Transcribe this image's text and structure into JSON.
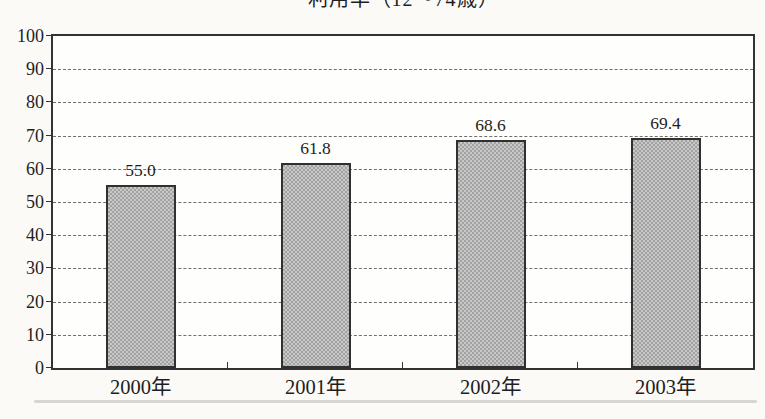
{
  "chart_data": {
    "type": "bar",
    "title": "利用率（12～74歳）",
    "title_note": "partially clipped at top edge of image",
    "categories": [
      "2000年",
      "2001年",
      "2002年",
      "2003年"
    ],
    "values": [
      55.0,
      61.8,
      68.6,
      69.4
    ],
    "value_labels": [
      "55.0",
      "61.8",
      "68.6",
      "69.4"
    ],
    "xlabel": "",
    "ylabel": "",
    "ylim": [
      0,
      100
    ],
    "yticks": [
      0,
      10,
      20,
      30,
      40,
      50,
      60,
      70,
      80,
      90,
      100
    ],
    "grid": "horizontal dashed gridlines at every 10 units",
    "legend": "none",
    "bar_style": "gray halftone-dot fill with dark border, single series"
  },
  "colors": {
    "background": "#fbfaf7",
    "plot_background": "#fefefd",
    "axis_border": "#333333",
    "gridline": "#6e6e6e",
    "bar_fill": "#c8c8c8",
    "bar_dot": "#a2a2a2",
    "bar_border": "#303030",
    "text": "#1e1e1e",
    "scan_artifact": "#cfcfcb"
  }
}
